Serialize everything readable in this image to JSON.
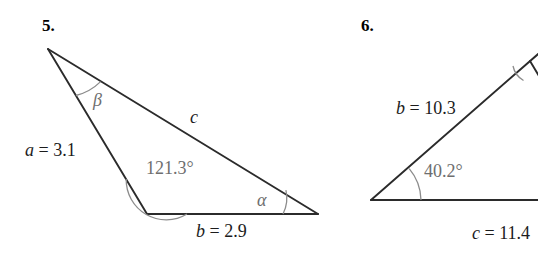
{
  "page": {
    "background_color": "#ffffff",
    "stroke_color": "#2b2b2b",
    "arc_color": "#8c8c8c",
    "label_color": "#1c1c1c",
    "angle_label_color": "#6e6e6e"
  },
  "figures": [
    {
      "number": "5.",
      "number_name": "problem-number-5",
      "sides": [
        {
          "name": "side-a-label",
          "text": "a = 3.1",
          "var": "a",
          "eq": " = ",
          "value": "3.1"
        },
        {
          "name": "side-b-label",
          "text": "b = 2.9",
          "var": "b",
          "eq": " = ",
          "value": "2.9"
        },
        {
          "name": "side-c-label",
          "text": "c",
          "var": "c",
          "eq": "",
          "value": ""
        }
      ],
      "angles": [
        {
          "name": "angle-beta-label",
          "text": "β"
        },
        {
          "name": "angle-121-label",
          "text": "121.3°"
        },
        {
          "name": "angle-alpha-label",
          "text": "α"
        }
      ]
    },
    {
      "number": "6.",
      "number_name": "problem-number-6",
      "sides": [
        {
          "name": "side-b-label",
          "text": "b = 10.3",
          "var": "b",
          "eq": " = ",
          "value": "10.3"
        },
        {
          "name": "side-c-label",
          "text": "c = 11.4",
          "var": "c",
          "eq": " = ",
          "value": "11.4"
        }
      ],
      "angles": [
        {
          "name": "angle-40-label",
          "text": "40.2°"
        }
      ]
    }
  ],
  "fig5": {
    "number": "5.",
    "label_a": "a = 3.1",
    "label_b": "b = 2.9",
    "label_c": "c",
    "label_beta": "β",
    "label_alpha": "α",
    "label_angle_obtuse": "121.3°"
  },
  "fig6": {
    "number": "6.",
    "label_b": "b = 10.3",
    "label_c": "c = 11.4",
    "label_angle": "40.2°"
  }
}
